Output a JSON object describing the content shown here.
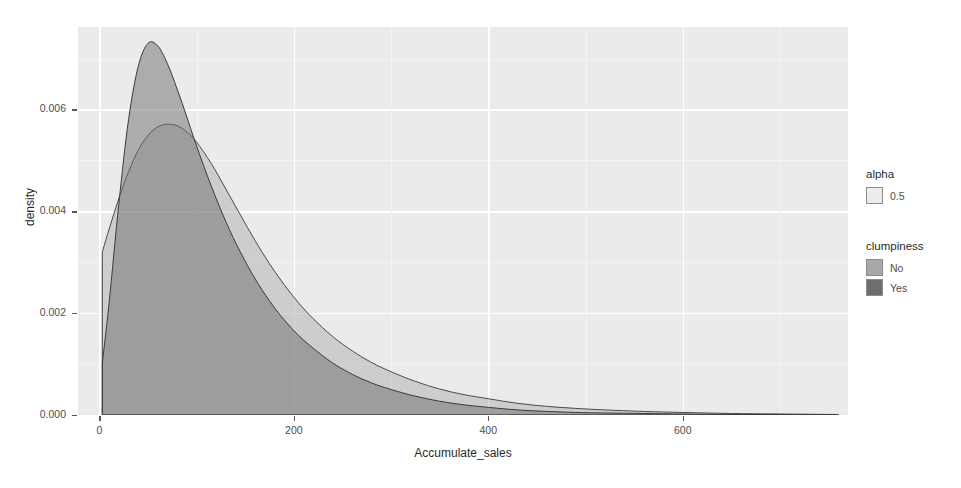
{
  "chart_data": {
    "type": "area",
    "title": "",
    "subtitle": "",
    "xlabel": "Accumulate_sales",
    "ylabel": "density",
    "xlim": [
      -22,
      770
    ],
    "ylim": [
      0,
      0.00762
    ],
    "xticks": [
      0,
      200,
      400,
      600
    ],
    "xtick_labels": [
      "0",
      "200",
      "400",
      "600"
    ],
    "yticks": [
      0.0,
      0.002,
      0.004,
      0.006
    ],
    "ytick_labels": [
      "0.000",
      "0.002",
      "0.004",
      "0.006"
    ],
    "grid": true,
    "grid_major_color": "#ffffff",
    "grid_minor_color": "#f4f4f4",
    "panel_background": "#ebebeb",
    "legend_position": "right",
    "series": [
      {
        "name": "No",
        "legend_label": "No",
        "fill": "#b0b0b0",
        "line": "#4a4a4a",
        "alpha": 0.5,
        "x": [
          3,
          10,
          20,
          30,
          40,
          50,
          60,
          70,
          80,
          90,
          100,
          115,
          130,
          145,
          160,
          175,
          190,
          205,
          220,
          240,
          260,
          280,
          300,
          325,
          350,
          375,
          400,
          430,
          460,
          490,
          520,
          560,
          600,
          650,
          700,
          760
        ],
        "y": [
          0.0032,
          0.00365,
          0.00425,
          0.00478,
          0.0052,
          0.00549,
          0.00566,
          0.00571,
          0.00568,
          0.00556,
          0.00536,
          0.00494,
          0.00444,
          0.00393,
          0.00343,
          0.00297,
          0.00256,
          0.0022,
          0.00189,
          0.00154,
          0.00126,
          0.00103,
          0.00085,
          0.00066,
          0.00051,
          0.0004,
          0.00032,
          0.00023,
          0.00017,
          0.00013,
          0.0001,
          7e-05,
          5e-05,
          3e-05,
          2e-05,
          1e-05
        ]
      },
      {
        "name": "Yes",
        "legend_label": "Yes",
        "fill": "#6e6e6e",
        "line": "#3a3a3a",
        "alpha": 0.5,
        "x": [
          3,
          10,
          20,
          30,
          40,
          50,
          60,
          70,
          80,
          90,
          100,
          115,
          130,
          145,
          160,
          175,
          190,
          205,
          220,
          240,
          260,
          280,
          300,
          325,
          350,
          375,
          400,
          430,
          460,
          490,
          520,
          560,
          600,
          650,
          700,
          760
        ],
        "y": [
          0.00102,
          0.0022,
          0.00415,
          0.0058,
          0.00685,
          0.0073,
          0.00725,
          0.0069,
          0.0064,
          0.00585,
          0.00528,
          0.0045,
          0.0038,
          0.0032,
          0.00268,
          0.00224,
          0.00187,
          0.00156,
          0.00131,
          0.00102,
          0.0008,
          0.00063,
          0.0005,
          0.00037,
          0.00027,
          0.0002,
          0.00015,
          0.0001,
          7e-05,
          5e-05,
          4e-05,
          3e-05,
          2e-05,
          1e-05,
          1e-05,
          0.0
        ]
      }
    ]
  },
  "legends": [
    {
      "title": "alpha",
      "items": [
        {
          "label": "0.5",
          "color": "#ececec"
        }
      ]
    },
    {
      "title": "clumpiness",
      "items": [
        {
          "label": "No",
          "color": "#a8a8a8"
        },
        {
          "label": "Yes",
          "color": "#6e6e6e"
        }
      ]
    }
  ]
}
